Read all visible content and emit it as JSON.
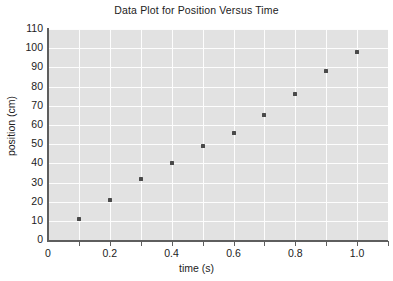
{
  "chart_data": {
    "type": "scatter",
    "title": "Data Plot for Position Versus Time",
    "xlabel": "time (s)",
    "ylabel": "position (cm)",
    "xlim": [
      0,
      1.1
    ],
    "ylim": [
      0,
      110
    ],
    "grid": true,
    "legend": null,
    "x": [
      0.1,
      0.2,
      0.3,
      0.4,
      0.5,
      0.6,
      0.7,
      0.8,
      0.9,
      1.0
    ],
    "y": [
      11,
      21,
      32,
      40,
      49,
      56,
      65,
      76,
      88,
      98
    ],
    "points": [
      {
        "x": 0.1,
        "y": 11
      },
      {
        "x": 0.2,
        "y": 21
      },
      {
        "x": 0.3,
        "y": 32
      },
      {
        "x": 0.4,
        "y": 40
      },
      {
        "x": 0.5,
        "y": 49
      },
      {
        "x": 0.6,
        "y": 56
      },
      {
        "x": 0.7,
        "y": 65
      },
      {
        "x": 0.8,
        "y": 76
      },
      {
        "x": 0.9,
        "y": 88
      },
      {
        "x": 1.0,
        "y": 98
      }
    ],
    "xticks": [
      0,
      0.2,
      0.4,
      0.6,
      0.8,
      1.0
    ],
    "xtick_labels": [
      "0",
      "0.2",
      "0.4",
      "0.6",
      "0.8",
      "1.0"
    ],
    "xtick_minor": [
      0.1,
      0.2,
      0.3,
      0.4,
      0.5,
      0.6,
      0.7,
      0.8,
      0.9,
      1.0,
      1.1
    ],
    "yticks": [
      0,
      10,
      20,
      30,
      40,
      50,
      60,
      70,
      80,
      90,
      100,
      110
    ],
    "ytick_labels": [
      "0",
      "10",
      "20",
      "30",
      "40",
      "50",
      "60",
      "70",
      "80",
      "90",
      "100",
      "110"
    ],
    "colors": {
      "plot_background": "#e2e2e2",
      "gridline": "#fdfdfd",
      "marker": "#4a4a4a",
      "axis": "#5e5e5e",
      "text": "#222222",
      "figure_background": "#ffffff"
    }
  }
}
